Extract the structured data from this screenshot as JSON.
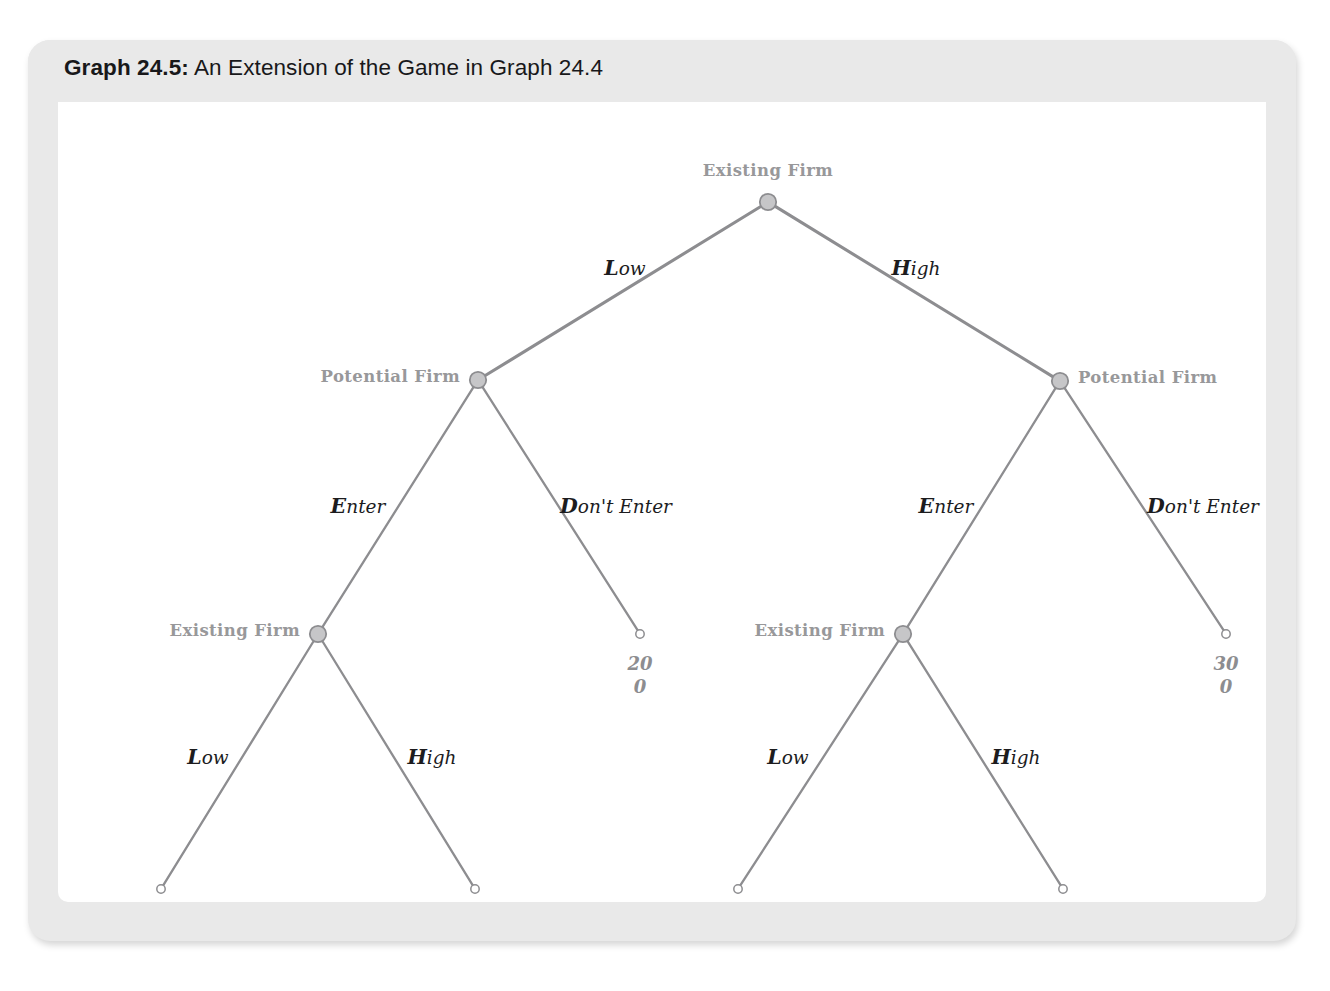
{
  "card": {
    "title_number": "Graph 24.5:",
    "title_text": " An Extension of the Game in Graph 24.4"
  },
  "colors": {
    "card_background": "#e9e9e9",
    "body_background": "#ffffff",
    "edge_stroke": "#8d8d90",
    "node_fill": "#c6c6c8",
    "node_stroke": "#8d8d90",
    "label_gray": "#98989a",
    "payoff_gray": "#8d8d90",
    "edge_label_black": "#1c1c1e"
  },
  "chart_data": {
    "type": "diagram",
    "diagram_kind": "extensive-form-game-tree",
    "title": "Graph 24.5: An Extension of the Game in Graph 24.4",
    "players": [
      "Existing Firm",
      "Potential Firm"
    ],
    "nodes": [
      {
        "id": "n0",
        "player": "Existing Firm",
        "x": 740,
        "y": 162,
        "kind": "decision",
        "label_side": "above"
      },
      {
        "id": "n1",
        "player": "Potential Firm",
        "x": 450,
        "y": 340,
        "kind": "decision",
        "label_side": "left"
      },
      {
        "id": "n2",
        "player": "Potential Firm",
        "x": 1032,
        "y": 341,
        "kind": "decision",
        "label_side": "right"
      },
      {
        "id": "n3",
        "player": "Existing Firm",
        "x": 290,
        "y": 594,
        "kind": "decision",
        "label_side": "left"
      },
      {
        "id": "t1",
        "player": "",
        "x": 612,
        "y": 594,
        "kind": "terminal",
        "label_side": "none"
      },
      {
        "id": "n4",
        "player": "Existing Firm",
        "x": 875,
        "y": 594,
        "kind": "decision",
        "label_side": "left"
      },
      {
        "id": "t2",
        "player": "",
        "x": 1198,
        "y": 594,
        "kind": "terminal",
        "label_side": "none"
      },
      {
        "id": "t3",
        "player": "",
        "x": 133,
        "y": 849,
        "kind": "terminal",
        "label_side": "none"
      },
      {
        "id": "t4",
        "player": "",
        "x": 447,
        "y": 849,
        "kind": "terminal",
        "label_side": "none"
      },
      {
        "id": "t5",
        "player": "",
        "x": 710,
        "y": 849,
        "kind": "terminal",
        "label_side": "none"
      },
      {
        "id": "t6",
        "player": "",
        "x": 1035,
        "y": 849,
        "kind": "terminal",
        "label_side": "none"
      }
    ],
    "edges": [
      {
        "from": "n0",
        "to": "n1",
        "label": "Low",
        "lx": 597,
        "ly": 228
      },
      {
        "from": "n0",
        "to": "n2",
        "label": "High",
        "lx": 888,
        "ly": 228
      },
      {
        "from": "n1",
        "to": "n3",
        "label": "Enter",
        "lx": 330,
        "ly": 466
      },
      {
        "from": "n1",
        "to": "t1",
        "label": "Don't Enter",
        "lx": 588,
        "ly": 466
      },
      {
        "from": "n2",
        "to": "n4",
        "label": "Enter",
        "lx": 918,
        "ly": 466
      },
      {
        "from": "n2",
        "to": "t2",
        "label": "Don't Enter",
        "lx": 1175,
        "ly": 466
      },
      {
        "from": "n3",
        "to": "t3",
        "label": "Low",
        "lx": 180,
        "ly": 717
      },
      {
        "from": "n3",
        "to": "t4",
        "label": "High",
        "lx": 404,
        "ly": 717
      },
      {
        "from": "n4",
        "to": "t5",
        "label": "Low",
        "lx": 760,
        "ly": 717
      },
      {
        "from": "n4",
        "to": "t6",
        "label": "High",
        "lx": 988,
        "ly": 717
      }
    ],
    "payoffs": [
      {
        "node": "t1",
        "x": 612,
        "y": 612,
        "top": "20",
        "bottom": "0"
      },
      {
        "node": "t2",
        "x": 1198,
        "y": 612,
        "top": "30",
        "bottom": "0"
      },
      {
        "node": "t3",
        "x": 133,
        "y": 867,
        "top": "10",
        "bottom": "−10"
      },
      {
        "node": "t4",
        "x": 447,
        "y": 867,
        "top": "−10",
        "bottom": "10"
      },
      {
        "node": "t5",
        "x": 710,
        "y": 867,
        "top": "10",
        "bottom": "−10"
      },
      {
        "node": "t6",
        "x": 1035,
        "y": 867,
        "top": "−10",
        "bottom": "10"
      }
    ],
    "node_labels": [
      {
        "node": "n0",
        "text": "Existing Firm",
        "x": 740,
        "y": 140,
        "anchor": "center"
      },
      {
        "node": "n1",
        "text": "Potential Firm",
        "x": 432,
        "y": 336,
        "anchor": "end"
      },
      {
        "node": "n2",
        "text": "Potential Firm",
        "x": 1050,
        "y": 337,
        "anchor": "start"
      },
      {
        "node": "n3",
        "text": "Existing Firm",
        "x": 272,
        "y": 590,
        "anchor": "end"
      },
      {
        "node": "n4",
        "text": "Existing Firm",
        "x": 857,
        "y": 590,
        "anchor": "end"
      }
    ],
    "edge_label_notes": "Each edge label renders its first character bold and the remainder italic, e.g. 'Low', 'High', 'Enter', \"Don't Enter\"."
  }
}
